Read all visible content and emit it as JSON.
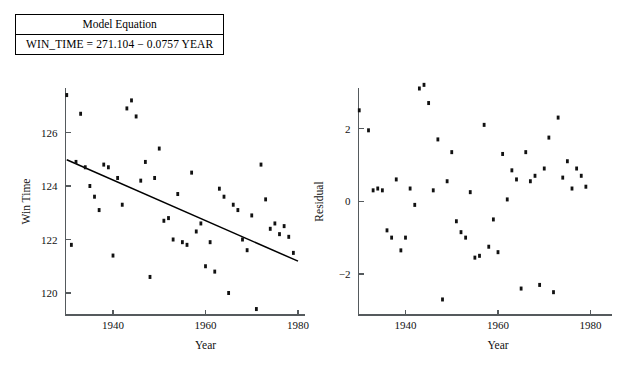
{
  "model_box": {
    "header": "Model Equation",
    "equation": "WIN_TIME = 271.104 − 0.0757 YEAR"
  },
  "chart_data": [
    {
      "type": "scatter",
      "id": "win-time-vs-year",
      "title": "",
      "xlabel": "Year",
      "ylabel": "Win Time",
      "xlim": [
        1929,
        1981
      ],
      "ylim": [
        119.0,
        127.6
      ],
      "xticks": [
        1940,
        1960,
        1980
      ],
      "xticklabels": [
        "1940",
        "1960",
        "1980"
      ],
      "yticks": [
        120,
        122,
        124,
        126
      ],
      "yticklabels": [
        "120",
        "122",
        "124",
        "126"
      ],
      "grid": false,
      "legend": "none",
      "fit_line": {
        "label": "least squares fit",
        "intercept": 271.104,
        "slope": -0.0757,
        "x_start": 1930,
        "x_end": 1980,
        "y_start": 124.98,
        "y_end": 121.19
      },
      "x": [
        1930,
        1931,
        1932,
        1933,
        1934,
        1935,
        1936,
        1937,
        1938,
        1939,
        1940,
        1941,
        1942,
        1943,
        1944,
        1945,
        1946,
        1947,
        1948,
        1949,
        1950,
        1951,
        1952,
        1953,
        1954,
        1955,
        1956,
        1957,
        1958,
        1959,
        1960,
        1961,
        1962,
        1963,
        1964,
        1965,
        1966,
        1967,
        1968,
        1969,
        1970,
        1971,
        1972,
        1973,
        1974,
        1975,
        1976,
        1977,
        1978,
        1979
      ],
      "y": [
        127.4,
        121.8,
        124.9,
        126.7,
        124.7,
        124.0,
        123.6,
        123.1,
        124.8,
        124.7,
        121.4,
        124.3,
        123.3,
        126.9,
        127.2,
        126.6,
        124.2,
        124.9,
        120.6,
        124.3,
        125.4,
        122.7,
        122.8,
        122.0,
        123.7,
        121.9,
        121.8,
        124.5,
        122.3,
        122.6,
        121.0,
        121.9,
        120.8,
        123.9,
        123.6,
        120.0,
        123.3,
        123.1,
        122.0,
        121.6,
        122.9,
        119.4,
        124.8,
        123.5,
        122.4,
        122.6,
        122.2,
        122.5,
        122.1,
        121.5
      ]
    },
    {
      "type": "scatter",
      "id": "residual-vs-year",
      "title": "",
      "xlabel": "Year",
      "ylabel": "Residual",
      "xlim": [
        1929,
        1981
      ],
      "ylim": [
        -3.4,
        3.4
      ],
      "xticks": [
        1940,
        1960,
        1980
      ],
      "xticklabels": [
        "1940",
        "1960",
        "1980"
      ],
      "yticks": [
        -2,
        0,
        2
      ],
      "yticklabels": [
        "−2",
        "0",
        "2"
      ],
      "grid": false,
      "legend": "none",
      "x": [
        1930,
        1931,
        1932,
        1933,
        1934,
        1935,
        1936,
        1937,
        1938,
        1939,
        1940,
        1941,
        1942,
        1943,
        1944,
        1945,
        1946,
        1947,
        1948,
        1949,
        1950,
        1951,
        1952,
        1953,
        1954,
        1955,
        1956,
        1957,
        1958,
        1959,
        1960,
        1961,
        1962,
        1963,
        1964,
        1965,
        1966,
        1967,
        1968,
        1969,
        1970,
        1971,
        1972,
        1973,
        1974,
        1975,
        1976,
        1977,
        1978,
        1979
      ],
      "y": [
        2.5,
        -3.2,
        1.95,
        0.3,
        0.35,
        0.3,
        -0.8,
        -1.0,
        0.6,
        -1.35,
        -1.0,
        0.35,
        -0.1,
        3.1,
        3.2,
        2.7,
        0.3,
        1.7,
        -2.7,
        0.55,
        1.35,
        -0.55,
        -0.85,
        -1.0,
        0.25,
        -1.55,
        -1.5,
        2.1,
        -1.25,
        -0.5,
        -1.4,
        1.3,
        0.05,
        0.85,
        0.6,
        -2.4,
        1.35,
        0.55,
        0.7,
        -2.3,
        0.9,
        1.75,
        -2.5,
        2.3,
        0.65,
        1.1,
        0.35,
        0.9,
        0.7,
        0.4
      ]
    }
  ]
}
